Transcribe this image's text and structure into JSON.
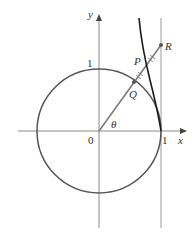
{
  "diagram": {
    "axes": {
      "x_label": "x",
      "y_label": "y"
    },
    "labels": {
      "origin": "0",
      "x_one": "1",
      "y_one": "1",
      "theta": "θ",
      "P": "P",
      "Q": "Q",
      "R": "R"
    },
    "elements": [
      "unit circle",
      "vertical line x = 1",
      "ray from origin at angle θ through Q to R",
      "curve through P tangent at (1,0)"
    ],
    "colors": {
      "axes": "#8a8a8a",
      "circle": "#555555",
      "curve": "#1a1a1a",
      "ray": "#777777"
    }
  }
}
